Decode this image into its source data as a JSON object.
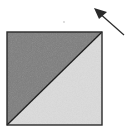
{
  "diagram": {
    "shapes": {
      "upper_left_triangle": {
        "fill": "#7d7d7d",
        "shade": "dark"
      },
      "lower_right_triangle": {
        "fill": "#dcdcdc",
        "shade": "light"
      },
      "square_outline": {
        "stroke": "#2a2a2a"
      },
      "diagonal": {
        "stroke": "#1e1e1e",
        "direction": "bottom-left to top-right"
      }
    },
    "arrow": {
      "color": "#2a2a2a",
      "points_toward": "upper-left"
    },
    "speck": {
      "color": "#cfcfcf"
    }
  }
}
